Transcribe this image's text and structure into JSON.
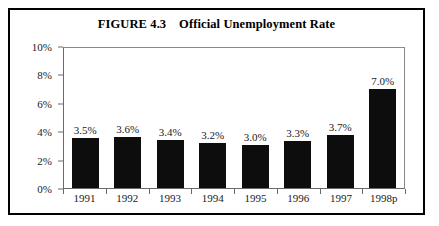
{
  "figure": {
    "title": "FIGURE 4.3    Official Unemployment Rate"
  },
  "chart_data": {
    "type": "bar",
    "title": "FIGURE 4.3    Official Unemployment Rate",
    "xlabel": "",
    "ylabel": "",
    "ylim": [
      0,
      10
    ],
    "yticks": [
      "0%",
      "2%",
      "4%",
      "6%",
      "8%",
      "10%"
    ],
    "ytick_values": [
      0,
      2,
      4,
      6,
      8,
      10
    ],
    "grid": false,
    "legend": "none",
    "bar_color": "#0d0d0d",
    "categories": [
      "1991",
      "1992",
      "1993",
      "1994",
      "1995",
      "1996",
      "1997",
      "1998p"
    ],
    "values": [
      3.5,
      3.6,
      3.4,
      3.2,
      3.0,
      3.3,
      3.7,
      7.0
    ],
    "value_labels": [
      "3.5%",
      "3.6%",
      "3.4%",
      "3.2%",
      "3.0%",
      "3.3%",
      "3.7%",
      "7.0%"
    ]
  }
}
